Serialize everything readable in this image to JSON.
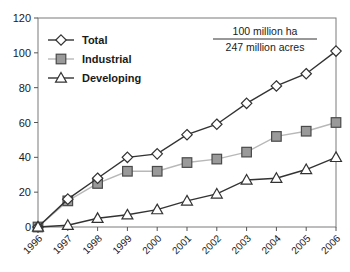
{
  "chart_data": {
    "type": "line",
    "title": "",
    "xlabel": "",
    "ylabel": "",
    "categories": [
      "1996",
      "1997",
      "1998",
      "1999",
      "2000",
      "2001",
      "2002",
      "2003",
      "2004",
      "2005",
      "2006"
    ],
    "series": [
      {
        "name": "Total",
        "values": [
          0,
          16,
          28,
          40,
          42,
          53,
          59,
          71,
          81,
          88,
          101
        ],
        "marker": "diamond",
        "marker_fill": "#ffffff",
        "line_color": "#333333"
      },
      {
        "name": "Industrial",
        "values": [
          0,
          15,
          25,
          32,
          32,
          37,
          39,
          43,
          52,
          55,
          60
        ],
        "marker": "square",
        "marker_fill": "#9a9a9a",
        "line_color": "#b8b8b8"
      },
      {
        "name": "Developing",
        "values": [
          0,
          1,
          5,
          7,
          10,
          15,
          19,
          27,
          28,
          33,
          40
        ],
        "marker": "triangle",
        "marker_fill": "#ffffff",
        "line_color": "#333333"
      }
    ],
    "ylim": [
      0,
      120
    ],
    "yticks": [
      0,
      20,
      40,
      60,
      80,
      100,
      120
    ],
    "grid": false,
    "legend_position": "top-left",
    "annotation": {
      "line1": "100 million ha",
      "line2": "247 million acres"
    }
  },
  "legend": {
    "items": [
      {
        "label": "Total"
      },
      {
        "label": "Industrial"
      },
      {
        "label": "Developing"
      }
    ]
  }
}
